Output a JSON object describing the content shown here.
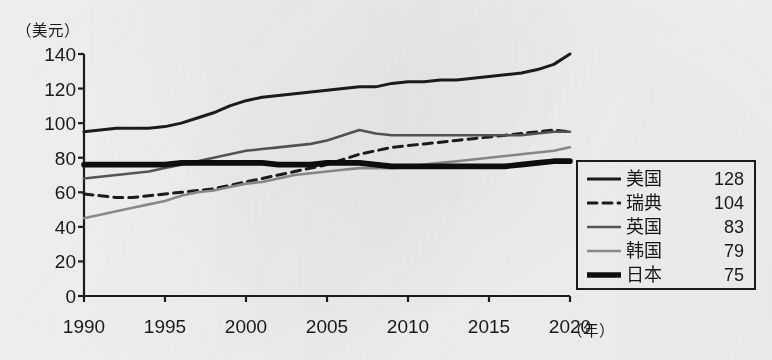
{
  "chart_data": {
    "type": "line",
    "title": "",
    "xlabel": "年",
    "ylabel": "美元",
    "y_unit_label": "（美元）",
    "x_unit_label": "（年）",
    "xlim": [
      1990,
      2020
    ],
    "ylim": [
      0,
      140
    ],
    "grid": false,
    "legend_position": "right",
    "y_ticks": [
      0,
      20,
      40,
      60,
      80,
      100,
      120,
      140
    ],
    "y_tick_labels": [
      "0",
      "20",
      "40",
      "60",
      "80",
      "100",
      "120",
      "140"
    ],
    "x_ticks": [
      1990,
      1995,
      2000,
      2005,
      2010,
      2015,
      2020
    ],
    "x_tick_labels": [
      "1990",
      "1995",
      "2000",
      "2005",
      "2010",
      "2015",
      "2020"
    ],
    "x": [
      1990,
      1991,
      1992,
      1993,
      1994,
      1995,
      1996,
      1997,
      1998,
      1999,
      2000,
      2001,
      2002,
      2003,
      2004,
      2005,
      2006,
      2007,
      2008,
      2009,
      2010,
      2011,
      2012,
      2013,
      2014,
      2015,
      2016,
      2017,
      2018,
      2019,
      2020
    ],
    "series": [
      {
        "name": "美国",
        "label": "美国",
        "end_value": 128,
        "style": "solid",
        "color": "#1c1c1c",
        "width": 3.0,
        "values": [
          95,
          96,
          97,
          97,
          97,
          98,
          100,
          103,
          106,
          110,
          113,
          115,
          116,
          117,
          118,
          119,
          120,
          121,
          121,
          123,
          124,
          124,
          125,
          125,
          126,
          127,
          128,
          129,
          131,
          134,
          140
        ]
      },
      {
        "name": "瑞典",
        "label": "瑞典",
        "end_value": 104,
        "style": "dashed",
        "color": "#1c1c1c",
        "width": 3.0,
        "values": [
          59,
          58,
          57,
          57,
          58,
          59,
          60,
          61,
          62,
          64,
          66,
          68,
          70,
          72,
          74,
          76,
          79,
          82,
          84,
          86,
          87,
          88,
          89,
          90,
          91,
          92,
          93,
          94,
          95,
          96,
          95
        ]
      },
      {
        "name": "英国",
        "label": "英国",
        "end_value": 83,
        "style": "solid",
        "color": "#575757",
        "width": 2.6,
        "values": [
          68,
          69,
          70,
          71,
          72,
          74,
          76,
          78,
          80,
          82,
          84,
          85,
          86,
          87,
          88,
          90,
          93,
          96,
          94,
          93,
          93,
          93,
          93,
          93,
          93,
          93,
          93,
          93,
          94,
          95,
          95
        ]
      },
      {
        "name": "韩国",
        "label": "韩国",
        "end_value": 79,
        "style": "solid",
        "color": "#8d8d8d",
        "width": 2.6,
        "values": [
          45,
          47,
          49,
          51,
          53,
          55,
          58,
          60,
          61,
          63,
          65,
          66,
          68,
          70,
          71,
          72,
          73,
          74,
          74,
          74,
          75,
          76,
          77,
          78,
          79,
          80,
          81,
          82,
          83,
          84,
          86
        ]
      },
      {
        "name": "日本",
        "label": "日本",
        "end_value": 75,
        "style": "solid",
        "color": "#0d0d0d",
        "width": 5.6,
        "values": [
          76,
          76,
          76,
          76,
          76,
          76,
          77,
          77,
          77,
          77,
          77,
          77,
          76,
          76,
          76,
          77,
          77,
          77,
          76,
          75,
          75,
          75,
          75,
          75,
          75,
          75,
          75,
          76,
          77,
          78,
          78
        ]
      }
    ]
  },
  "legend": {
    "rows": [
      {
        "label": "美国",
        "value": "128"
      },
      {
        "label": "瑞典",
        "value": "104"
      },
      {
        "label": "英国",
        "value": "83"
      },
      {
        "label": "韩国",
        "value": "79"
      },
      {
        "label": "日本",
        "value": "75"
      }
    ]
  }
}
